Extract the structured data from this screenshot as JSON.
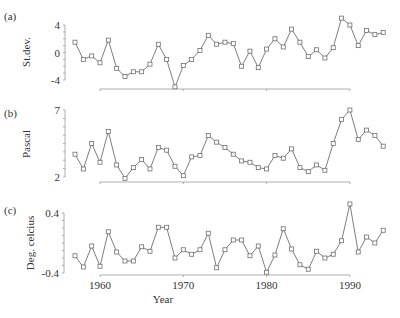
{
  "chart_data": [
    {
      "type": "line",
      "panel_label": "(a)",
      "title": "",
      "xlabel": "",
      "ylabel": "St.dev.",
      "ylim": [
        -4,
        4
      ],
      "yticks": [
        4,
        0,
        -4
      ],
      "ytick_labels": [
        "4",
        "0",
        "-4"
      ],
      "xlim": [
        1957,
        1994
      ],
      "grid": false,
      "marker": "square",
      "x": [
        1957,
        1958,
        1959,
        1960,
        1961,
        1962,
        1963,
        1964,
        1965,
        1966,
        1967,
        1968,
        1969,
        1970,
        1971,
        1972,
        1973,
        1974,
        1975,
        1976,
        1977,
        1978,
        1979,
        1980,
        1981,
        1982,
        1983,
        1984,
        1985,
        1986,
        1987,
        1988,
        1989,
        1990,
        1991,
        1992,
        1993,
        1994
      ],
      "values": [
        1.5,
        -1.0,
        -0.5,
        -1.5,
        1.8,
        -2.3,
        -3.5,
        -2.8,
        -2.8,
        -1.7,
        1.2,
        -1.0,
        -5.0,
        -1.9,
        -1.0,
        0.3,
        2.5,
        1.2,
        1.5,
        1.3,
        -2.0,
        0.2,
        -2.2,
        0.5,
        2.0,
        0.8,
        3.4,
        1.5,
        -0.6,
        0.4,
        -0.8,
        0.7,
        5.0,
        4.0,
        1.0,
        3.2,
        2.6,
        2.9
      ]
    },
    {
      "type": "line",
      "panel_label": "(b)",
      "title": "",
      "xlabel": "",
      "ylabel": "Pascal",
      "ylim": [
        2,
        7
      ],
      "yticks": [
        7,
        2
      ],
      "ytick_labels": [
        "7",
        "2"
      ],
      "xlim": [
        1957,
        1994
      ],
      "grid": false,
      "marker": "square",
      "x": [
        1957,
        1958,
        1959,
        1960,
        1961,
        1962,
        1963,
        1964,
        1965,
        1966,
        1967,
        1968,
        1969,
        1970,
        1971,
        1972,
        1973,
        1974,
        1975,
        1976,
        1977,
        1978,
        1979,
        1980,
        1981,
        1982,
        1983,
        1984,
        1985,
        1986,
        1987,
        1988,
        1989,
        1990,
        1991,
        1992,
        1993,
        1994
      ],
      "values": [
        3.7,
        2.6,
        4.5,
        3.1,
        5.4,
        2.9,
        1.9,
        2.7,
        3.3,
        2.6,
        4.2,
        4.0,
        2.8,
        2.1,
        3.5,
        3.6,
        5.1,
        4.6,
        4.2,
        3.7,
        3.2,
        3.1,
        2.7,
        2.6,
        3.6,
        3.4,
        4.1,
        2.7,
        2.4,
        2.9,
        2.5,
        4.5,
        6.3,
        7.0,
        4.8,
        5.5,
        5.1,
        4.3
      ]
    },
    {
      "type": "line",
      "panel_label": "(c)",
      "title": "",
      "xlabel": "Year",
      "ylabel": "Deg. celcius",
      "ylim": [
        -0.4,
        0.4
      ],
      "yticks": [
        0.4,
        -0.4
      ],
      "ytick_labels": [
        "0.4",
        "-0.4"
      ],
      "xlim": [
        1957,
        1994
      ],
      "xticks": [
        1960,
        1970,
        1980,
        1990
      ],
      "xtick_labels": [
        "1960",
        "1970",
        "1980",
        "1990"
      ],
      "grid": false,
      "marker": "square",
      "x": [
        1957,
        1958,
        1959,
        1960,
        1961,
        1962,
        1963,
        1964,
        1965,
        1966,
        1967,
        1968,
        1969,
        1970,
        1971,
        1972,
        1973,
        1974,
        1975,
        1976,
        1977,
        1978,
        1979,
        1980,
        1981,
        1982,
        1983,
        1984,
        1985,
        1986,
        1987,
        1988,
        1989,
        1990,
        1991,
        1992,
        1993,
        1994
      ],
      "values": [
        -0.17,
        -0.32,
        -0.04,
        -0.31,
        0.15,
        -0.12,
        -0.24,
        -0.24,
        -0.05,
        -0.11,
        0.21,
        0.21,
        -0.2,
        -0.09,
        -0.15,
        -0.09,
        0.13,
        -0.33,
        -0.09,
        0.04,
        0.04,
        -0.17,
        -0.04,
        -0.39,
        -0.16,
        0.19,
        -0.08,
        -0.29,
        -0.35,
        -0.11,
        -0.2,
        -0.15,
        0.03,
        0.52,
        -0.12,
        0.08,
        0.0,
        0.17
      ]
    }
  ],
  "layout": {
    "x_year_origin": 1960,
    "x_px_at_origin": 100,
    "x_px_per_year": 8.33,
    "x_axis_start_year": 1960,
    "x_axis_end_year": 1990,
    "panels": [
      {
        "top_px": 25,
        "bottom_px": 80,
        "axis_x_px": 65,
        "baseline_px": 89,
        "panel_label_xy": [
          4,
          20
        ],
        "ylabel_center": [
          30,
          52
        ]
      },
      {
        "top_px": 110,
        "bottom_px": 177,
        "axis_x_px": 65,
        "baseline_px": 182,
        "panel_label_xy": [
          4,
          117
        ],
        "ylabel_center": [
          30,
          144
        ]
      },
      {
        "top_px": 213,
        "bottom_px": 273,
        "axis_x_px": 64,
        "baseline_px": 275,
        "panel_label_xy": [
          4,
          214
        ],
        "ylabel_center": [
          34,
          243
        ]
      }
    ],
    "xtick_label_y": 289,
    "xlabel_xy": [
      163,
      303
    ]
  }
}
